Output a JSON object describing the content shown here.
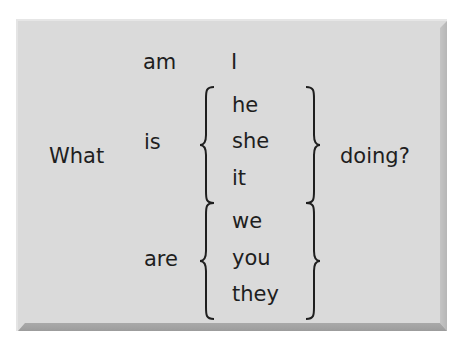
{
  "figure": {
    "question_start": "What",
    "question_end": "doing?",
    "rows": [
      {
        "verb": "am",
        "subjects": [
          "I"
        ]
      },
      {
        "verb": "is",
        "subjects": [
          "he",
          "she",
          "it"
        ]
      },
      {
        "verb": "are",
        "subjects": [
          "we",
          "you",
          "they"
        ]
      }
    ],
    "colors": {
      "panel_background": "#dadada",
      "text": "#1e1e1e",
      "bevel_dark": "#9c9c9c"
    }
  }
}
